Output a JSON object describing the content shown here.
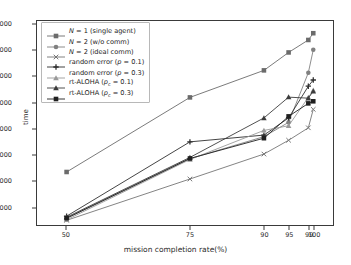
{
  "chart_data": {
    "type": "line",
    "title": "",
    "xlabel": "mission completion rate(%)",
    "ylabel": "time",
    "x": [
      50,
      75,
      90,
      95,
      99,
      100
    ],
    "xtick_labels": [
      "50",
      "75",
      "90",
      "95",
      "99",
      "100"
    ],
    "ytick_labels": [
      "3000",
      "4000",
      "5000",
      "6000",
      "7000",
      "8000",
      "9000",
      "10000"
    ],
    "yticks": [
      3000,
      4000,
      5000,
      6000,
      7000,
      8000,
      9000,
      10000
    ],
    "xlim": [
      44,
      104
    ],
    "ylim": [
      2300,
      10150
    ],
    "grid": false,
    "legend_position": "upper left",
    "series": [
      {
        "name": "N = 1 (single agent)",
        "label_html": "<i>N</i> = 1 (single agent)",
        "marker": "square",
        "color": "#6b6b6b",
        "values": [
          4340,
          7210,
          8250,
          8940,
          9420,
          9680
        ]
      },
      {
        "name": "N = 2 (w/o comm)",
        "label_html": "<i>N</i> = 2 (w/o comm)",
        "marker": "circle",
        "color": "#808080",
        "values": [
          2560,
          4850,
          5700,
          6250,
          8160,
          9040
        ]
      },
      {
        "name": "N = 2 (ideal comm)",
        "label_html": "<i>N</i> = 2 (ideal comm)",
        "marker": "x",
        "color": "#757575",
        "values": [
          2480,
          4070,
          5030,
          5560,
          6040,
          6750
        ]
      },
      {
        "name": "random error (p = 0.1)",
        "label_html": "random error (<i>p</i> = 0.1)",
        "marker": "plus",
        "color": "#2e2e2e",
        "values": [
          2640,
          5500,
          5760,
          6420,
          7640,
          7880
        ]
      },
      {
        "name": "random error (p = 0.3)",
        "label_html": "random error (<i>p</i> = 0.3)",
        "marker": "triangle",
        "color": "#9a9a9a",
        "values": [
          2500,
          4820,
          5940,
          6120,
          7210,
          7480
        ]
      },
      {
        "name": "rt-ALOHA (p_c = 0.1)",
        "label_html": "rt-ALOHA (<i>p</i><sub>c</sub> = 0.1)",
        "marker": "triangle-dark",
        "color": "#3c3c3c",
        "values": [
          2600,
          4900,
          6420,
          7220,
          7180,
          7450
        ]
      },
      {
        "name": "rt-ALOHA (p_c = 0.3)",
        "label_html": "rt-ALOHA (<i>p</i><sub>c</sub> = 0.3)",
        "marker": "square-dark",
        "color": "#1f1f1f",
        "values": [
          2560,
          4860,
          5640,
          6480,
          6980,
          7060
        ]
      }
    ]
  }
}
